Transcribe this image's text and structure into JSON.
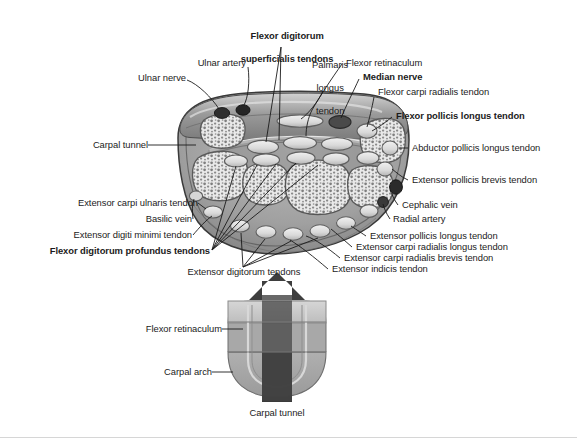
{
  "figure": {
    "background_color": "#ffffff",
    "line_color": "#1b1b1b",
    "text_color": "#1b1b1b"
  },
  "palette": {
    "skin_outer": "#8f8f8f",
    "skin_mid": "#a8a8a8",
    "skin_light": "#c9c9c9",
    "tendon_fill": "#dedede",
    "tendon_outline": "#6e6e6e",
    "bone_speckle": "#f0f0f0",
    "bone_matrix": "#8a8a8a",
    "vessel_dark": "#2e2e2e",
    "arrow_dark": "#4a4a4a",
    "retinaculum_light": "#c6c6c6",
    "carpal_arch_mid": "#a3a3a3"
  },
  "labels": {
    "flexor_digitorum_superficialis": "Flexor digitorum\nsuperficialis tendons",
    "palmaris_longus": "Palmaris\nlongus\ntendon",
    "ulnar_artery": "Ulnar artery",
    "ulnar_nerve": "Ulnar nerve",
    "flexor_retinaculum": "Flexor retinaculum",
    "median_nerve": "Median nerve",
    "flexor_carpi_radialis": "Flexor carpi radialis tendon",
    "flexor_pollicis_longus": "Flexor pollicis longus tendon",
    "carpal_tunnel": "Carpal tunnel",
    "abductor_pollicis_longus": "Abductor pollicis longus tendon",
    "extensor_pollicis_brevis": "Extensor pollicis brevis tendon",
    "cephalic_vein": "Cephalic vein",
    "radial_artery": "Radial artery",
    "extensor_carpi_ulnaris": "Extensor carpi ulnaris tendon",
    "basilic_vein": "Basilic vein",
    "extensor_digiti_minimi": "Extensor digiti minimi tendon",
    "flexor_digitorum_profundus": "Flexor digitorum profundus tendons",
    "extensor_digitorum": "Extensor digitorum tendons",
    "extensor_pollicis_longus": "Extensor pollicis longus tendon",
    "extensor_carpi_radialis_longus": "Extensor carpi radialis longus tendon",
    "extensor_carpi_radialis_brevis": "Extensor carpi radialis brevis tendon",
    "extensor_indicis": "Extensor indicis tendon"
  },
  "label_lines": {
    "flexor_digitorum_superficialis_1": "Flexor digitorum",
    "flexor_digitorum_superficialis_2": "superficialis tendons",
    "palmaris_longus_1": "Palmaris",
    "palmaris_longus_2": "longus",
    "palmaris_longus_3": "tendon"
  },
  "lower_diagram": {
    "flexor_retinaculum": "Flexor retinaculum",
    "carpal_arch": "Carpal arch",
    "carpal_tunnel": "Carpal tunnel"
  },
  "bold_labels": [
    "Flexor digitorum superficialis tendons",
    "Median nerve",
    "Flexor pollicis longus tendon",
    "Flexor digitorum profundus tendons"
  ]
}
